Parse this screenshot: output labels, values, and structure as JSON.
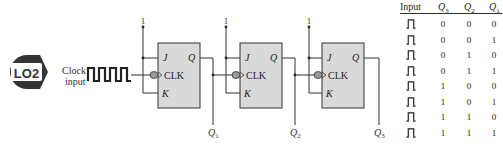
{
  "badge": {
    "label": "LO2",
    "color": "#333333"
  },
  "clock": {
    "label_line1": "Clock",
    "label_line2": "input"
  },
  "supply_label": "1",
  "flip_flops": [
    {
      "id": "ff1",
      "pins": {
        "j": "J",
        "k": "K",
        "clk": "CLK",
        "q": "Q"
      },
      "output_label": "Q",
      "output_sub": "1"
    },
    {
      "id": "ff2",
      "pins": {
        "j": "J",
        "k": "K",
        "clk": "CLK",
        "q": "Q"
      },
      "output_label": "Q",
      "output_sub": "2"
    },
    {
      "id": "ff3",
      "pins": {
        "j": "J",
        "k": "K",
        "clk": "CLK",
        "q": "Q"
      },
      "output_label": "Q",
      "output_sub": "3"
    }
  ],
  "colors": {
    "ff_fill": "#d9d9d9",
    "ff_stroke": "#333333",
    "wire": "#333333",
    "bubble": "#9a9a9a"
  },
  "truth_table": {
    "headers": [
      {
        "label": "Input",
        "sub": ""
      },
      {
        "label": "Q",
        "sub": "3"
      },
      {
        "label": "Q",
        "sub": "2"
      },
      {
        "label": "Q",
        "sub": "1"
      }
    ],
    "input_icon": "clock-pulse-icon",
    "rows": [
      {
        "q3": "0",
        "q2": "0",
        "q1": "0"
      },
      {
        "q3": "0",
        "q2": "0",
        "q1": "1"
      },
      {
        "q3": "0",
        "q2": "1",
        "q1": "0"
      },
      {
        "q3": "0",
        "q2": "1",
        "q1": "1"
      },
      {
        "q3": "1",
        "q2": "0",
        "q1": "0"
      },
      {
        "q3": "1",
        "q2": "0",
        "q1": "1"
      },
      {
        "q3": "1",
        "q2": "1",
        "q1": "0"
      },
      {
        "q3": "1",
        "q2": "1",
        "q1": "1"
      }
    ]
  }
}
